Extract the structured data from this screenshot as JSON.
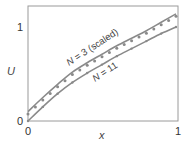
{
  "chart_data": {
    "type": "line",
    "title": "",
    "xlabel": "x",
    "ylabel": "U",
    "xlim": [
      0,
      1
    ],
    "ylim": [
      0,
      1.2
    ],
    "xticks": [
      "0",
      "1"
    ],
    "yticks": [
      "0",
      "1"
    ],
    "grid": false,
    "legend": "inline curve labels",
    "x": [
      0,
      0.1,
      0.2,
      0.3,
      0.4,
      0.5,
      0.6,
      0.7,
      0.8,
      0.9,
      1.0
    ],
    "series": [
      {
        "name": "N = 3 (scaled)",
        "style": "solid line with dot markers",
        "values": [
          0.1,
          0.25,
          0.39,
          0.52,
          0.62,
          0.71,
          0.8,
          0.88,
          0.96,
          1.05,
          1.14
        ]
      },
      {
        "name": "N = 11",
        "style": "solid line",
        "values": [
          0.0,
          0.15,
          0.29,
          0.41,
          0.51,
          0.6,
          0.69,
          0.77,
          0.85,
          0.93,
          1.0
        ]
      }
    ],
    "annotations": [
      "N = 3 (scaled)",
      "N = 11"
    ]
  },
  "labels": {
    "ylabel": "U",
    "xlabel": "x",
    "xtick0": "0",
    "xtick1": "1",
    "ytick0": "0",
    "ytick1": "1",
    "curve1_prefix": "N",
    "curve1_rest": " = 3 (scaled)",
    "curve2_prefix": "N",
    "curve2_rest": " = 11"
  },
  "colors": {
    "line": "#8a8a8a",
    "frame": "#999999",
    "text": "#444444"
  }
}
